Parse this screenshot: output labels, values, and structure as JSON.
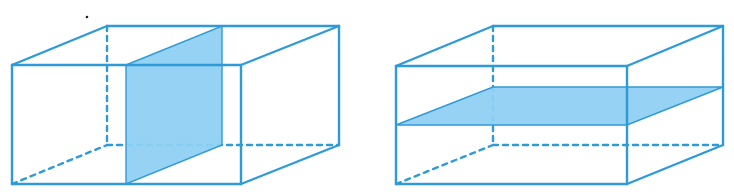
{
  "figure": {
    "width": 734,
    "height": 195,
    "colors": {
      "edge": "#2f9ad8",
      "fill": "#8fd0f3",
      "background": "#ffffff",
      "dot": "#222222"
    },
    "stroke_width": 2.4,
    "dash": "5,5"
  },
  "boxes": [
    {
      "name": "left-cuboid",
      "description": "Cuboid cut by a vertical plane parallel to the side faces",
      "front": {
        "x1": 12,
        "x2": 241,
        "y_top": 65,
        "y_bottom": 184
      },
      "back": {
        "x1": 107,
        "x2": 339,
        "y_top": 26,
        "y_bottom": 145
      },
      "section": {
        "orientation": "vertical",
        "polygon": [
          [
            126,
            65
          ],
          [
            222,
            26
          ],
          [
            222,
            145
          ],
          [
            126,
            184
          ]
        ]
      }
    },
    {
      "name": "right-cuboid",
      "description": "Cuboid cut by a horizontal plane parallel to the base",
      "front": {
        "x1": 396,
        "x2": 627,
        "y_top": 66,
        "y_bottom": 184
      },
      "back": {
        "x1": 493,
        "x2": 723,
        "y_top": 26,
        "y_bottom": 145
      },
      "section": {
        "orientation": "horizontal",
        "polygon": [
          [
            396,
            125
          ],
          [
            493,
            87
          ],
          [
            723,
            87
          ],
          [
            627,
            125
          ]
        ]
      }
    }
  ],
  "marks": [
    {
      "name": "stray-dot",
      "x": 87,
      "y": 17,
      "r": 1.3
    }
  ]
}
